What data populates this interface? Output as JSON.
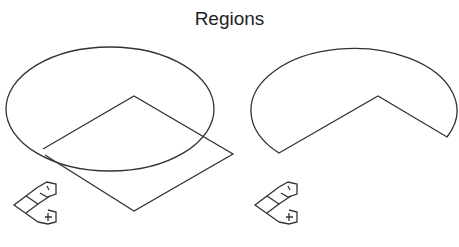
{
  "title": "Regions",
  "colors": {
    "stroke": "#333333",
    "background": "#ffffff"
  },
  "panels": [
    {
      "name": "union-input",
      "shapes": [
        {
          "type": "ellipse",
          "cx": 110,
          "cy": 109,
          "rx": 104,
          "ry": 62
        },
        {
          "type": "polygon",
          "points": [
            [
              134,
              96
            ],
            [
              233,
              154
            ],
            [
              134,
              211
            ],
            [
              43,
              151
            ]
          ]
        }
      ],
      "icon": "axis-orientation-icon"
    },
    {
      "name": "difference-result",
      "shapes": [
        {
          "type": "ellipse-with-notch",
          "cx": 350,
          "cy": 109,
          "rx": 103,
          "ry": 62,
          "notch_vertex": [
            378,
            96
          ],
          "cut_left": [
            279,
            153
          ],
          "cut_right": [
            447,
            137
          ]
        }
      ],
      "icon": "axis-orientation-icon"
    }
  ]
}
